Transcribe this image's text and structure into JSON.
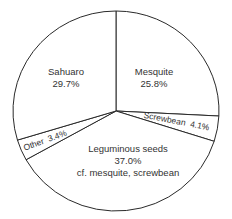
{
  "chart_data": {
    "type": "pie",
    "title": "",
    "start_angle_deg": -90,
    "direction": "clockwise",
    "center": [
      116,
      111
    ],
    "radius": [
      103,
      100
    ],
    "slices": [
      {
        "label": "Mesquite",
        "value": 25.8,
        "value_text": "25.8%",
        "sublabel": ""
      },
      {
        "label": "Screwbean",
        "value": 4.1,
        "value_text": "4.1%",
        "sublabel": ""
      },
      {
        "label": "Leguminous seeds",
        "value": 37.0,
        "value_text": "37.0%",
        "sublabel": "cf. mesquite, screwbean"
      },
      {
        "label": "Other",
        "value": 3.4,
        "value_text": "3.4%",
        "sublabel": ""
      },
      {
        "label": "Sahuaro",
        "value": 29.7,
        "value_text": "29.7%",
        "sublabel": ""
      }
    ],
    "legend": "none",
    "colors": {
      "fill": "#ffffff",
      "stroke": "#2a2a2a",
      "text": "#333333"
    }
  },
  "labels": {
    "mesquite": {
      "name": "Mesquite",
      "pct": "25.8%"
    },
    "screwbean": {
      "text": "Screwbean  4.1%"
    },
    "leguminous": {
      "name": "Leguminous seeds",
      "pct": "37.0%",
      "note": "cf. mesquite, screwbean"
    },
    "other": {
      "text": "Other  3.4%"
    },
    "sahuaro": {
      "name": "Sahuaro",
      "pct": "29.7%"
    }
  }
}
